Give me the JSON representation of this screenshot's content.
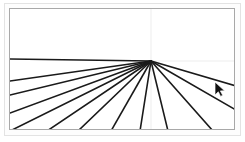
{
  "app": {
    "title": "Paint Canvas",
    "background_color": "#ffffff",
    "outer_frame_color": "#e3e3e3",
    "canvas_border_color": "#a8a8a8"
  },
  "canvas": {
    "name": "drawing-canvas",
    "width": 226,
    "height": 122,
    "background_color": "#ffffff",
    "stroke_color": "#1a1a1a",
    "stroke_width": 1.6,
    "guide_color": "#ededed",
    "guide_width": 1,
    "origin": {
      "x": 141,
      "y": 52
    },
    "guides": [
      {
        "name": "vertical-guide",
        "x1": 141,
        "y1": 0,
        "x2": 141,
        "y2": 122
      },
      {
        "name": "horizontal-guide",
        "x1": 141,
        "y1": 52,
        "x2": 226,
        "y2": 52
      }
    ],
    "rays": [
      {
        "id": "ray-1",
        "angle_deg": 181,
        "x2": 0,
        "y2": 50
      },
      {
        "id": "ray-2",
        "angle_deg": 188,
        "x2": 0,
        "y2": 72
      },
      {
        "id": "ray-3",
        "angle_deg": 194,
        "x2": 0,
        "y2": 86
      },
      {
        "id": "ray-4",
        "angle_deg": 201,
        "x2": 0,
        "y2": 104
      },
      {
        "id": "ray-5",
        "angle_deg": 208,
        "x2": 0,
        "y2": 122
      },
      {
        "id": "ray-6",
        "angle_deg": 216,
        "x2": 37,
        "y2": 122
      },
      {
        "id": "ray-7",
        "angle_deg": 226,
        "x2": 68,
        "y2": 122
      },
      {
        "id": "ray-8",
        "angle_deg": 240,
        "x2": 101,
        "y2": 122
      },
      {
        "id": "ray-9",
        "angle_deg": 261,
        "x2": 130,
        "y2": 122
      },
      {
        "id": "ray-10",
        "angle_deg": 285,
        "x2": 158,
        "y2": 122
      },
      {
        "id": "ray-11",
        "angle_deg": 312,
        "x2": 203,
        "y2": 122
      },
      {
        "id": "ray-12",
        "angle_deg": 330,
        "x2": 226,
        "y2": 101
      },
      {
        "id": "ray-13",
        "angle_deg": 343,
        "x2": 226,
        "y2": 77
      }
    ]
  },
  "cursor": {
    "name": "mouse-pointer",
    "x": 215,
    "y": 82,
    "color": "#111111",
    "type": "arrow"
  }
}
